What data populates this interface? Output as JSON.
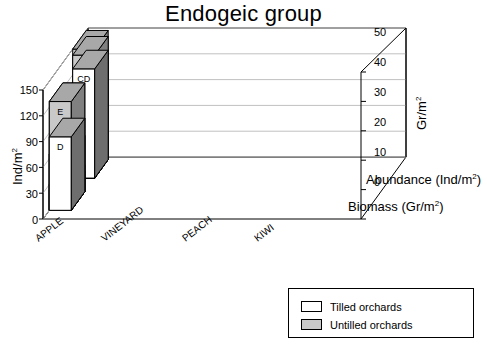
{
  "title": "Endogeic group",
  "legend": {
    "items": [
      {
        "label": "Tilled orchards",
        "swatch": "white"
      },
      {
        "label": "Untilled orchards",
        "swatch": "gray"
      }
    ]
  },
  "axes": {
    "left_title_main": "Ind/m",
    "left_title_sup": "2",
    "right_title_main": "Gr/m",
    "right_title_sup": "2",
    "depth_back_main": "Abundance (Ind/m",
    "depth_back_sup": "2",
    "depth_back_tail": ")",
    "depth_front_main": "Biomass (Gr/m",
    "depth_front_sup": "2",
    "depth_front_tail": ")",
    "left_ticks": [
      "150",
      "120",
      "90",
      "60",
      "30",
      "0"
    ],
    "right_ticks": [
      "50",
      "40",
      "30",
      "20",
      "10",
      "0"
    ],
    "categories": [
      "APPLE",
      "VINEYARD",
      "PEACH",
      "KIWI"
    ]
  },
  "chart_data": {
    "type": "bar",
    "title": "Endogeic group",
    "subtitle": "",
    "xlabel": "",
    "ylabel": "Ind/m2",
    "y2label": "Gr/m2",
    "zlabel": "",
    "three_d": true,
    "grid": true,
    "legend_position": "bottom-right",
    "categories": [
      "APPLE",
      "VINEYARD",
      "PEACH",
      "KIWI"
    ],
    "depth_rows": [
      {
        "name": "Abundance (Ind/m2)",
        "axis": "left",
        "ylim": [
          0,
          150
        ],
        "ticks": [
          0,
          30,
          60,
          90,
          120,
          150
        ]
      },
      {
        "name": "Biomass (Gr/m2)",
        "axis": "right",
        "ylim": [
          0,
          50
        ],
        "ticks": [
          0,
          10,
          20,
          30,
          40,
          50
        ]
      }
    ],
    "series": [
      {
        "name": "Untilled orchards",
        "fill": "#c9c9c9",
        "row": "Abundance (Ind/m2)",
        "values": [
          112,
          60,
          150,
          143
        ],
        "labels": [
          "C",
          "B",
          "D",
          "D"
        ]
      },
      {
        "name": "Tilled orchards",
        "fill": "#ffffff",
        "row": "Abundance (Ind/m2)",
        "values": [
          112,
          50,
          118,
          127
        ],
        "labels": [
          "C",
          "A",
          "CD",
          "CD"
        ]
      },
      {
        "name": "Untilled orchards",
        "fill": "#c9c9c9",
        "row": "Biomass (Gr/m2)",
        "values": [
          19,
          9,
          37,
          37
        ],
        "labels": [
          "C",
          "B",
          "E",
          "E"
        ]
      },
      {
        "name": "Tilled orchards",
        "fill": "#ffffff",
        "row": "Biomass (Gr/m2)",
        "values": [
          19,
          7,
          25,
          25
        ],
        "labels": [
          "C",
          "A",
          "D",
          "D"
        ]
      }
    ],
    "annotations": [
      "Letters on bars denote statistical significance groupings"
    ]
  },
  "colors": {
    "bar_gray_front": "#c9c9c9",
    "bar_gray_top": "#a8a8a8",
    "bar_gray_side": "#808080",
    "bar_white_front": "#ffffff",
    "bar_white_top": "#a8a8a8",
    "bar_white_side": "#6e6e6e",
    "axis": "#000000",
    "grid": "#c0c0c0",
    "floor": "#ffffff"
  }
}
